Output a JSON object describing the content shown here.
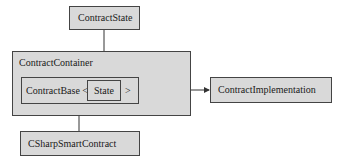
{
  "diagram": {
    "nodes": {
      "contract_state": "ContractState",
      "contract_container": "ContractContainer",
      "contract_base": "ContractBase <",
      "state": "State",
      "generic_close": ">",
      "contract_implementation": "ContractImplementation",
      "csharp_smart_contract": "CSharpSmartContract"
    },
    "edges": [
      {
        "from": "ContractState",
        "to": "State"
      },
      {
        "from": "CSharpSmartContract",
        "to": "ContractBase"
      },
      {
        "from": "ContractBase",
        "to": "ContractImplementation"
      }
    ],
    "colors": {
      "box_fill": "#d9d9d9",
      "border": "#444444",
      "line": "#333333"
    }
  }
}
